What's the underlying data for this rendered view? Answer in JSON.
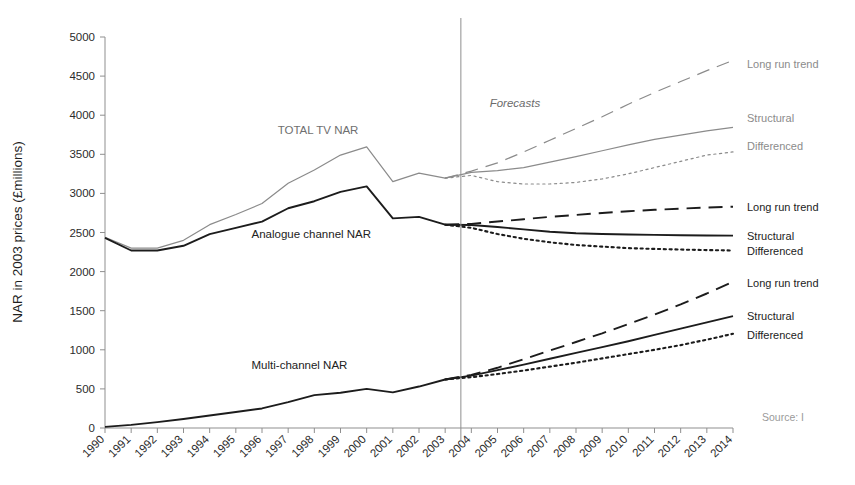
{
  "chart_data": {
    "type": "line",
    "title": "",
    "xlabel": "",
    "ylabel": "NAR in 2003 prices (£millions)",
    "ylim": [
      0,
      5000
    ],
    "ytick_labels": [
      "0",
      "500",
      "1000",
      "1500",
      "2000",
      "2500",
      "3000",
      "3500",
      "4000",
      "4500",
      "5000"
    ],
    "ytick_values": [
      0,
      500,
      1000,
      1500,
      2000,
      2500,
      3000,
      3500,
      4000,
      4500,
      5000
    ],
    "grid": false,
    "legend_position": "right-inline",
    "x": [
      1990,
      1991,
      1992,
      1993,
      1994,
      1995,
      1996,
      1997,
      1998,
      1999,
      2000,
      2001,
      2002,
      2003,
      2004,
      2005,
      2006,
      2007,
      2008,
      2009,
      2010,
      2011,
      2012,
      2013,
      2014
    ],
    "categories": [
      "1990",
      "1991",
      "1992",
      "1993",
      "1994",
      "1995",
      "1996",
      "1997",
      "1998",
      "1999",
      "2000",
      "2001",
      "2002",
      "2003",
      "2004",
      "2005",
      "2006",
      "2007",
      "2008",
      "2009",
      "2010",
      "2011",
      "2012",
      "2013",
      "2014"
    ],
    "forecast_start_year": 2004,
    "forecast_divider_year": 2003.6,
    "annotations": [
      {
        "text": "TOTAL TV NAR",
        "x": 1996.6,
        "y": 3760,
        "color": "#8b8b8b"
      },
      {
        "text": "Analogue channel NAR",
        "x": 1995.6,
        "y": 2430,
        "color": "#222222"
      },
      {
        "text": "Multi-channel NAR",
        "x": 1995.6,
        "y": 760,
        "color": "#2b2b2b"
      },
      {
        "text": "Forecasts",
        "x": 2004.7,
        "y": 4110,
        "color": "#6b6b6b"
      }
    ],
    "source_note": "Source: I",
    "series": [
      {
        "name": "TOTAL TV NAR",
        "group": "total-tv",
        "style": "solid",
        "color": "#8b8b8b",
        "phase": "historical",
        "x": [
          1990,
          1991,
          1992,
          1993,
          1994,
          1995,
          1996,
          1997,
          1998,
          1999,
          2000,
          2001,
          2002,
          2003
        ],
        "values": [
          2440,
          2300,
          2300,
          2400,
          2600,
          2730,
          2870,
          3130,
          3300,
          3490,
          3595,
          3150,
          3260,
          3195
        ]
      },
      {
        "name": "TOTAL TV NAR Long run trend",
        "group": "total-tv",
        "style": "dashed",
        "color": "#8b8b8b",
        "phase": "forecast",
        "x": [
          2003,
          2004,
          2005,
          2006,
          2007,
          2008,
          2009,
          2010,
          2011,
          2012,
          2013,
          2014
        ],
        "values": [
          3195,
          3285,
          3390,
          3530,
          3680,
          3830,
          3980,
          4140,
          4290,
          4430,
          4570,
          4700
        ]
      },
      {
        "name": "TOTAL TV NAR Structural",
        "group": "total-tv",
        "style": "solid",
        "color": "#8b8b8b",
        "phase": "forecast",
        "x": [
          2003,
          2004,
          2005,
          2006,
          2007,
          2008,
          2009,
          2010,
          2011,
          2012,
          2013,
          2014
        ],
        "values": [
          3195,
          3270,
          3290,
          3330,
          3400,
          3470,
          3545,
          3620,
          3690,
          3745,
          3800,
          3845
        ]
      },
      {
        "name": "TOTAL TV NAR Differenced",
        "group": "total-tv",
        "style": "dotted",
        "color": "#8b8b8b",
        "phase": "forecast",
        "x": [
          2003,
          2004,
          2005,
          2006,
          2007,
          2008,
          2009,
          2010,
          2011,
          2012,
          2013,
          2014
        ],
        "values": [
          3195,
          3230,
          3150,
          3120,
          3120,
          3140,
          3185,
          3250,
          3330,
          3410,
          3490,
          3530
        ]
      },
      {
        "name": "Analogue channel NAR",
        "group": "analogue",
        "style": "solid",
        "color": "#1c1c1c",
        "phase": "historical",
        "x": [
          1990,
          1991,
          1992,
          1993,
          1994,
          1995,
          1996,
          1997,
          1998,
          1999,
          2000,
          2001,
          2002,
          2003
        ],
        "values": [
          2430,
          2270,
          2270,
          2330,
          2480,
          2560,
          2640,
          2810,
          2900,
          3020,
          3090,
          2680,
          2700,
          2600
        ]
      },
      {
        "name": "Analogue Long run trend",
        "group": "analogue",
        "style": "dashed",
        "color": "#1c1c1c",
        "phase": "forecast",
        "x": [
          2003,
          2004,
          2005,
          2006,
          2007,
          2008,
          2009,
          2010,
          2011,
          2012,
          2013,
          2014
        ],
        "values": [
          2600,
          2610,
          2640,
          2670,
          2700,
          2725,
          2750,
          2772,
          2790,
          2805,
          2820,
          2830
        ]
      },
      {
        "name": "Analogue Structural",
        "group": "analogue",
        "style": "solid",
        "color": "#1c1c1c",
        "phase": "forecast",
        "x": [
          2003,
          2004,
          2005,
          2006,
          2007,
          2008,
          2009,
          2010,
          2011,
          2012,
          2013,
          2014
        ],
        "values": [
          2600,
          2595,
          2570,
          2540,
          2510,
          2490,
          2480,
          2475,
          2470,
          2465,
          2462,
          2460
        ]
      },
      {
        "name": "Analogue Differenced",
        "group": "analogue",
        "style": "dotted",
        "color": "#1c1c1c",
        "phase": "forecast",
        "x": [
          2003,
          2004,
          2005,
          2006,
          2007,
          2008,
          2009,
          2010,
          2011,
          2012,
          2013,
          2014
        ],
        "values": [
          2600,
          2560,
          2480,
          2420,
          2375,
          2340,
          2320,
          2300,
          2290,
          2282,
          2275,
          2270
        ]
      },
      {
        "name": "Multi-channel NAR",
        "group": "multi-channel",
        "style": "solid",
        "color": "#1c1c1c",
        "phase": "historical",
        "x": [
          1990,
          1991,
          1992,
          1993,
          1994,
          1995,
          1996,
          1997,
          1998,
          1999,
          2000,
          2001,
          2002,
          2003
        ],
        "values": [
          15,
          40,
          75,
          115,
          160,
          205,
          250,
          330,
          420,
          450,
          500,
          455,
          530,
          620
        ]
      },
      {
        "name": "Multi-channel Long run trend",
        "group": "multi-channel",
        "style": "dashed",
        "color": "#1c1c1c",
        "phase": "forecast",
        "x": [
          2003,
          2004,
          2005,
          2006,
          2007,
          2008,
          2009,
          2010,
          2011,
          2012,
          2013,
          2014
        ],
        "values": [
          620,
          680,
          770,
          880,
          990,
          1100,
          1210,
          1330,
          1450,
          1580,
          1720,
          1870
        ]
      },
      {
        "name": "Multi-channel Structural",
        "group": "multi-channel",
        "style": "solid",
        "color": "#1c1c1c",
        "phase": "forecast",
        "x": [
          2003,
          2004,
          2005,
          2006,
          2007,
          2008,
          2009,
          2010,
          2011,
          2012,
          2013,
          2014
        ],
        "values": [
          620,
          670,
          740,
          810,
          885,
          960,
          1035,
          1110,
          1190,
          1270,
          1350,
          1430
        ]
      },
      {
        "name": "Multi-channel Differenced",
        "group": "multi-channel",
        "style": "dotted",
        "color": "#1c1c1c",
        "phase": "forecast",
        "x": [
          2003,
          2004,
          2005,
          2006,
          2007,
          2008,
          2009,
          2010,
          2011,
          2012,
          2013,
          2014
        ],
        "values": [
          620,
          650,
          690,
          735,
          785,
          835,
          890,
          945,
          1000,
          1060,
          1130,
          1205
        ]
      }
    ],
    "right_labels": [
      {
        "text": "Long run trend",
        "y": 4660,
        "color": "#8b8b8b"
      },
      {
        "text": "Structural",
        "y": 3960,
        "color": "#8b8b8b"
      },
      {
        "text": "Differenced",
        "y": 3610,
        "color": "#8b8b8b"
      },
      {
        "text": "Long run trend",
        "y": 2830,
        "color": "#1c1c1c"
      },
      {
        "text": "Structural",
        "y": 2460,
        "color": "#1c1c1c"
      },
      {
        "text": "Differenced",
        "y": 2265,
        "color": "#1c1c1c"
      },
      {
        "text": "Long run trend",
        "y": 1860,
        "color": "#1c1c1c"
      },
      {
        "text": "Structural",
        "y": 1430,
        "color": "#1c1c1c"
      },
      {
        "text": "Differenced",
        "y": 1195,
        "color": "#1c1c1c"
      }
    ]
  }
}
